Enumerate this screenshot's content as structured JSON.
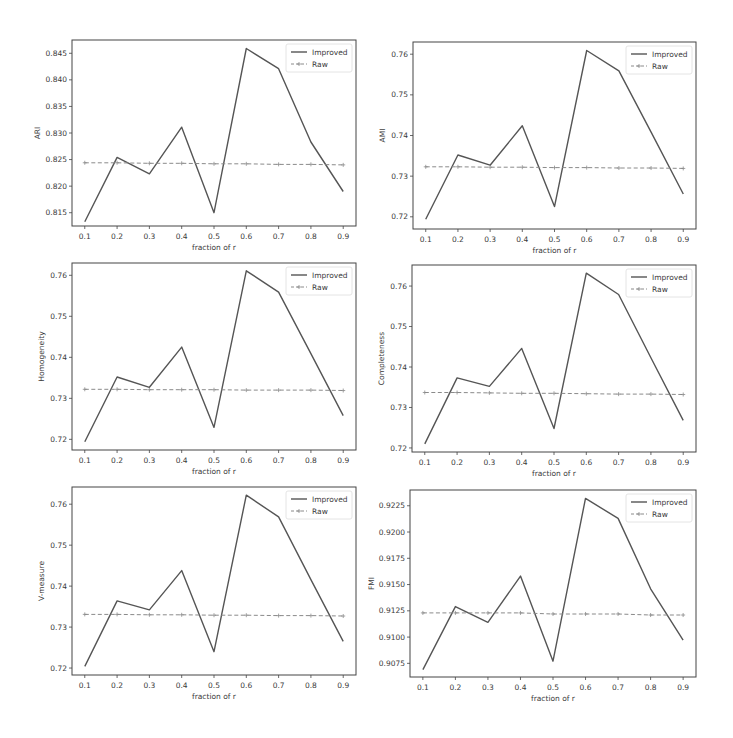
{
  "layout": {
    "grid": "3x2",
    "x_label": "fraction of r",
    "legend": {
      "position": "upper right",
      "entries": [
        "Improved",
        "Raw"
      ]
    },
    "colors": {
      "improved": "#555555",
      "raw": "#8a8a8a",
      "frame": "#444444",
      "text": "#3a3a3a"
    }
  },
  "chart_data": [
    {
      "type": "line",
      "title": "",
      "xlabel": "fraction of r",
      "ylabel": "ARI",
      "x": [
        0.1,
        0.2,
        0.3,
        0.4,
        0.5,
        0.6,
        0.7,
        0.8,
        0.9
      ],
      "x_ticks": [
        "0.1",
        "0.2",
        "0.3",
        "0.4",
        "0.5",
        "0.6",
        "0.7",
        "0.8",
        "0.9"
      ],
      "y_ticks": [
        "0.815",
        "0.820",
        "0.825",
        "0.830",
        "0.835",
        "0.840",
        "0.845"
      ],
      "ylim": [
        0.8125,
        0.8475
      ],
      "grid": false,
      "legend_position": "upper right",
      "series": [
        {
          "name": "Improved",
          "style": "solid",
          "values": [
            0.8133,
            0.8254,
            0.8223,
            0.8311,
            0.815,
            0.8459,
            0.8421,
            0.8283,
            0.819
          ]
        },
        {
          "name": "Raw",
          "style": "dashed",
          "marker": "+",
          "values": [
            0.8244,
            0.8244,
            0.8243,
            0.8243,
            0.8242,
            0.8242,
            0.8241,
            0.8241,
            0.824
          ]
        }
      ],
      "box": {
        "x": 72,
        "y": 40,
        "w": 284,
        "h": 186
      }
    },
    {
      "type": "line",
      "title": "",
      "xlabel": "fraction of r",
      "ylabel": "AMI",
      "x": [
        0.1,
        0.2,
        0.3,
        0.4,
        0.5,
        0.6,
        0.7,
        0.8,
        0.9
      ],
      "x_ticks": [
        "0.1",
        "0.2",
        "0.3",
        "0.4",
        "0.5",
        "0.6",
        "0.7",
        "0.8",
        "0.9"
      ],
      "y_ticks": [
        "0.72",
        "0.73",
        "0.74",
        "0.75",
        "0.76"
      ],
      "ylim": [
        0.717,
        0.763
      ],
      "grid": false,
      "legend_position": "upper right",
      "series": [
        {
          "name": "Improved",
          "style": "solid",
          "values": [
            0.7194,
            0.7352,
            0.7327,
            0.7424,
            0.7225,
            0.7609,
            0.7559,
            0.7408,
            0.7256
          ]
        },
        {
          "name": "Raw",
          "style": "dashed",
          "marker": "+",
          "values": [
            0.7323,
            0.7323,
            0.7322,
            0.7322,
            0.7321,
            0.7321,
            0.732,
            0.732,
            0.7319
          ]
        }
      ],
      "box": {
        "x": 413,
        "y": 42,
        "w": 283,
        "h": 187
      }
    },
    {
      "type": "line",
      "title": "",
      "xlabel": "fraction of r",
      "ylabel": "Homogeneity",
      "x": [
        0.1,
        0.2,
        0.3,
        0.4,
        0.5,
        0.6,
        0.7,
        0.8,
        0.9
      ],
      "x_ticks": [
        "0.1",
        "0.2",
        "0.3",
        "0.4",
        "0.5",
        "0.6",
        "0.7",
        "0.8",
        "0.9"
      ],
      "y_ticks": [
        "0.72",
        "0.73",
        "0.74",
        "0.75",
        "0.76"
      ],
      "ylim": [
        0.7174,
        0.763
      ],
      "grid": false,
      "legend_position": "upper right",
      "series": [
        {
          "name": "Improved",
          "style": "solid",
          "values": [
            0.7194,
            0.7352,
            0.7327,
            0.7425,
            0.7229,
            0.7611,
            0.7559,
            0.7409,
            0.7258
          ]
        },
        {
          "name": "Raw",
          "style": "dashed",
          "marker": "+",
          "values": [
            0.7322,
            0.7322,
            0.7321,
            0.7321,
            0.7321,
            0.732,
            0.732,
            0.732,
            0.7319
          ]
        }
      ],
      "box": {
        "x": 72,
        "y": 263,
        "w": 284,
        "h": 187
      }
    },
    {
      "type": "line",
      "title": "",
      "xlabel": "fraction of r",
      "ylabel": "Completeness",
      "x": [
        0.1,
        0.2,
        0.3,
        0.4,
        0.5,
        0.6,
        0.7,
        0.8,
        0.9
      ],
      "x_ticks": [
        "0.1",
        "0.2",
        "0.3",
        "0.4",
        "0.5",
        "0.6",
        "0.7",
        "0.8",
        "0.9"
      ],
      "y_ticks": [
        "0.72",
        "0.73",
        "0.74",
        "0.75",
        "0.76"
      ],
      "ylim": [
        0.719,
        0.7652
      ],
      "grid": false,
      "legend_position": "upper right",
      "series": [
        {
          "name": "Improved",
          "style": "solid",
          "values": [
            0.721,
            0.7373,
            0.7352,
            0.7446,
            0.7248,
            0.7632,
            0.7579,
            0.7423,
            0.7268
          ]
        },
        {
          "name": "Raw",
          "style": "dashed",
          "marker": "+",
          "values": [
            0.7337,
            0.7337,
            0.7336,
            0.7335,
            0.7335,
            0.7334,
            0.7333,
            0.7333,
            0.7332
          ]
        }
      ],
      "box": {
        "x": 412,
        "y": 265,
        "w": 284,
        "h": 187
      }
    },
    {
      "type": "line",
      "title": "",
      "xlabel": "fraction of r",
      "ylabel": "V-measure",
      "x": [
        0.1,
        0.2,
        0.3,
        0.4,
        0.5,
        0.6,
        0.7,
        0.8,
        0.9
      ],
      "x_ticks": [
        "0.1",
        "0.2",
        "0.3",
        "0.4",
        "0.5",
        "0.6",
        "0.7",
        "0.8",
        "0.9"
      ],
      "y_ticks": [
        "0.72",
        "0.73",
        "0.74",
        "0.75",
        "0.76"
      ],
      "ylim": [
        0.7183,
        0.7642
      ],
      "grid": false,
      "legend_position": "upper right",
      "series": [
        {
          "name": "Improved",
          "style": "solid",
          "values": [
            0.7204,
            0.7364,
            0.7342,
            0.7438,
            0.724,
            0.7622,
            0.7569,
            0.7416,
            0.7265
          ]
        },
        {
          "name": "Raw",
          "style": "dashed",
          "marker": "+",
          "values": [
            0.7331,
            0.7331,
            0.733,
            0.733,
            0.7329,
            0.7329,
            0.7328,
            0.7328,
            0.7327
          ]
        }
      ],
      "box": {
        "x": 72,
        "y": 487,
        "w": 284,
        "h": 188
      }
    },
    {
      "type": "line",
      "title": "",
      "xlabel": "fraction of r",
      "ylabel": "FMI",
      "x": [
        0.1,
        0.2,
        0.3,
        0.4,
        0.5,
        0.6,
        0.7,
        0.8,
        0.9
      ],
      "x_ticks": [
        "0.1",
        "0.2",
        "0.3",
        "0.4",
        "0.5",
        "0.6",
        "0.7",
        "0.8",
        "0.9"
      ],
      "y_ticks": [
        "0.9075",
        "0.9100",
        "0.9125",
        "0.9150",
        "0.9175",
        "0.9200",
        "0.9225"
      ],
      "ylim": [
        0.9062,
        0.924
      ],
      "grid": false,
      "legend_position": "upper right",
      "series": [
        {
          "name": "Improved",
          "style": "solid",
          "values": [
            0.9069,
            0.9129,
            0.9114,
            0.9158,
            0.9077,
            0.9232,
            0.9213,
            0.9146,
            0.9097
          ]
        },
        {
          "name": "Raw",
          "style": "dashed",
          "marker": "+",
          "values": [
            0.9123,
            0.9123,
            0.9123,
            0.9123,
            0.9122,
            0.9122,
            0.9122,
            0.9121,
            0.9121
          ]
        }
      ],
      "box": {
        "x": 410,
        "y": 490,
        "w": 286,
        "h": 187
      }
    }
  ]
}
